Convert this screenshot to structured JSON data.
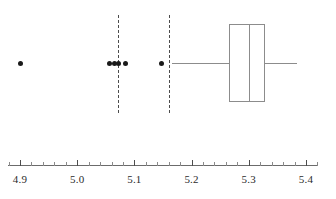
{
  "chart_data": {
    "type": "box",
    "title": "",
    "xlabel": "",
    "ylabel": "",
    "orientation": "horizontal",
    "xlim": [
      4.88,
      5.42
    ],
    "grid": false,
    "legend": false,
    "axis": {
      "major_ticks": [
        4.9,
        5.0,
        5.1,
        5.2,
        5.3,
        5.4
      ],
      "tick_labels": [
        "4.9",
        "5.0",
        "5.1",
        "5.2",
        "5.3",
        "5.4"
      ],
      "minor_tick_step": 0.02,
      "minor_ticks": [
        4.88,
        4.92,
        4.94,
        4.96,
        4.98,
        5.02,
        5.04,
        5.06,
        5.08,
        5.12,
        5.14,
        5.16,
        5.18,
        5.22,
        5.24,
        5.26,
        5.28,
        5.32,
        5.34,
        5.36,
        5.38,
        5.4,
        5.42
      ]
    },
    "series": [
      {
        "name": "box-1",
        "whisker_low": 5.165,
        "q1": 5.266,
        "median": 5.3,
        "q3": 5.328,
        "whisker_high": 5.385,
        "outliers": [
          4.9,
          5.057,
          5.066,
          5.073,
          5.085,
          5.148
        ]
      }
    ],
    "reference_lines": [
      {
        "name": "lower-fence",
        "value": 5.072,
        "style": "dashed"
      },
      {
        "name": "upper-fence",
        "value": 5.16,
        "style": "dashed"
      }
    ],
    "colors": {
      "box_stroke": "#8c8c8c",
      "median_stroke": "#8c8c8c",
      "whisker_stroke": "#8c8c8c",
      "outlier_fill": "#1a1a1a",
      "reference_line": "#4d4d4d",
      "axis": "#6b6b6b",
      "tick_label": "#2b2b2b",
      "background": "#ffffff"
    }
  }
}
